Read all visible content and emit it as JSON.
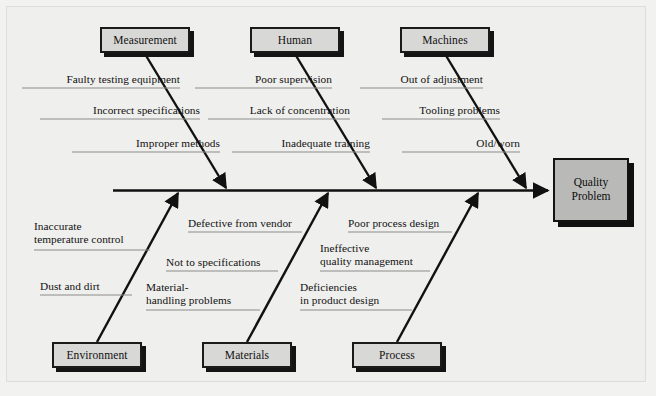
{
  "diagram": {
    "type": "fishbone-ishikawa",
    "effect": {
      "line1": "Quality",
      "line2": "Problem"
    },
    "colors": {
      "page_background": "#f2f2f0",
      "panel_background": "#efefed",
      "category_box_fill": "#d8d8d6",
      "effect_box_fill": "#b9b9b7",
      "line_stroke": "#111111",
      "cause_rule": "#8c8c8c"
    },
    "categories": [
      {
        "name": "Measurement",
        "position": "top",
        "causes": [
          "Faulty testing equipment",
          "Incorrect specifications",
          "Improper methods"
        ]
      },
      {
        "name": "Human",
        "position": "top",
        "causes": [
          "Poor supervision",
          "Lack of concentration",
          "Inadequate training"
        ]
      },
      {
        "name": "Machines",
        "position": "top",
        "causes": [
          "Out of adjustment",
          "Tooling problems",
          "Old/worn"
        ]
      },
      {
        "name": "Environment",
        "position": "bottom",
        "causes": [
          "Inaccurate\ntemperature control",
          "Dust and dirt"
        ]
      },
      {
        "name": "Materials",
        "position": "bottom",
        "causes": [
          "Defective from vendor",
          "Not to specifications",
          "Material-\nhandling problems"
        ]
      },
      {
        "name": "Process",
        "position": "bottom",
        "causes": [
          "Poor process design",
          "Ineffective\nquality management",
          "Deficiencies\nin product design"
        ]
      }
    ]
  }
}
